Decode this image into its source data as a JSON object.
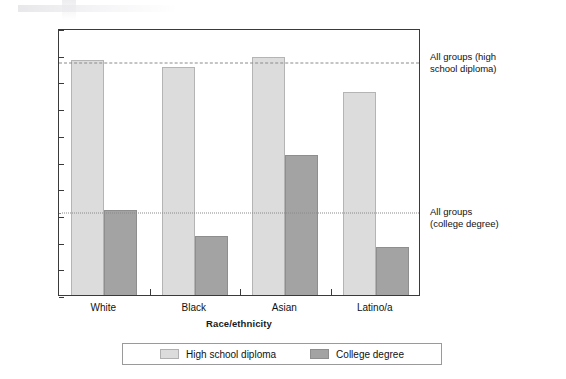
{
  "chart_data": {
    "type": "bar",
    "title": "",
    "xlabel": "Race/ethnicity",
    "ylabel": "Percentage who complete education",
    "categories": [
      "White",
      "Black",
      "Asian",
      "Latino/a"
    ],
    "ylim": [
      0,
      100
    ],
    "y_ticks": [
      0,
      10,
      20,
      30,
      40,
      50,
      60,
      70,
      80,
      90,
      100
    ],
    "grid": false,
    "legend_position": "bottom",
    "series": [
      {
        "name": "High school diploma",
        "color": "#dcdcdc",
        "values": [
          88,
          85.5,
          89,
          76
        ]
      },
      {
        "name": "College degree",
        "color": "#a3a3a3",
        "values": [
          32,
          22,
          52.5,
          18
        ]
      }
    ],
    "reference_lines": [
      {
        "id": "hs",
        "value": 87.5,
        "style": "dashed",
        "color": "#8a8a8a",
        "label": "All groups (high school diploma)",
        "label_lines": [
          "All groups (high",
          "school diploma)"
        ]
      },
      {
        "id": "cd",
        "value": 31.5,
        "style": "dotted",
        "color": "#8a8a8a",
        "label": "All groups (college degree)",
        "label_lines": [
          "All groups",
          "(college degree)"
        ]
      }
    ]
  },
  "legend": {
    "items": [
      {
        "label": "High school diploma",
        "swatch": "hs"
      },
      {
        "label": "College degree",
        "swatch": "cd"
      }
    ]
  }
}
